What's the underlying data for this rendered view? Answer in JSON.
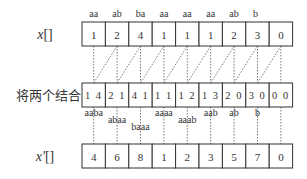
{
  "rows": {
    "x": {
      "label_var": "x",
      "label_suffix": "[]",
      "values": [
        "1",
        "2",
        "4",
        "1",
        "1",
        "1",
        "2",
        "3",
        "0"
      ],
      "suffixes": [
        "aa",
        "ab",
        "ba",
        "aa",
        "aa",
        "aa",
        "ab",
        "b",
        ""
      ]
    },
    "combined": {
      "label": "将两个结合",
      "values": [
        "1 4",
        "2 1",
        "4 1",
        "1 1",
        "1 2",
        "1 3",
        "2 0",
        "3 0",
        "0 0"
      ],
      "suffixes": [
        "aaba",
        "abaa",
        "baaa",
        "aaaa",
        "aaab",
        "aab",
        "ab",
        "b",
        ""
      ]
    },
    "x_prime": {
      "label_var": "x'",
      "label_suffix": "[]",
      "values": [
        "4",
        "6",
        "8",
        "1",
        "2",
        "3",
        "5",
        "7",
        "0"
      ]
    }
  }
}
